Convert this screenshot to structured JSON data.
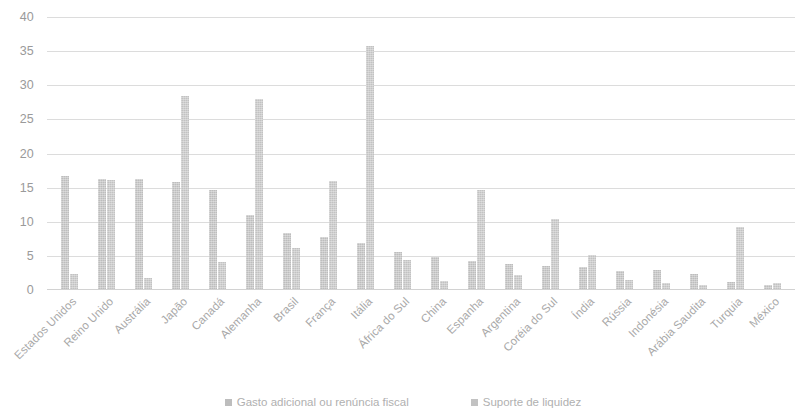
{
  "chart_data": {
    "type": "bar",
    "title": "",
    "xlabel": "",
    "ylabel": "",
    "ylim": [
      0,
      40
    ],
    "ytick_step": 5,
    "yticks": [
      "40",
      "35",
      "30",
      "25",
      "20",
      "15",
      "10",
      "5",
      "0"
    ],
    "grid": "horizontal",
    "legend_position": "bottom",
    "x_label_rotation": -45,
    "bar_color": "#bdbdbd",
    "gridline_color": "#dcdcdc",
    "axis_text_color": "#9a9a9a",
    "categories": [
      "Estados Unidos",
      "Reino Unido",
      "Austrália",
      "Japão",
      "Canadá",
      "Alemanha",
      "Brasil",
      "França",
      "Itália",
      "África do Sul",
      "China",
      "Espanha",
      "Argentina",
      "Coréia do Sul",
      "Índia",
      "Rússia",
      "Indonésia",
      "Arábia Saudita",
      "Turquia",
      "México"
    ],
    "series": [
      {
        "name": "Gasto adicional ou renúncia fiscal",
        "color": "#bdbdbd",
        "values": [
          16.7,
          16.3,
          16.3,
          15.8,
          14.7,
          11.0,
          8.3,
          7.8,
          6.9,
          5.5,
          4.8,
          4.3,
          3.8,
          3.5,
          3.3,
          2.8,
          2.9,
          2.4,
          1.2,
          0.7
        ]
      },
      {
        "name": "Suporte de liquidez",
        "color": "#c2c2c2",
        "values": [
          2.4,
          16.1,
          1.8,
          28.5,
          4.1,
          28.0,
          6.2,
          16.0,
          35.7,
          4.4,
          1.3,
          14.7,
          2.2,
          10.4,
          5.2,
          1.5,
          1.0,
          0.8,
          9.3,
          1.1
        ]
      }
    ]
  }
}
